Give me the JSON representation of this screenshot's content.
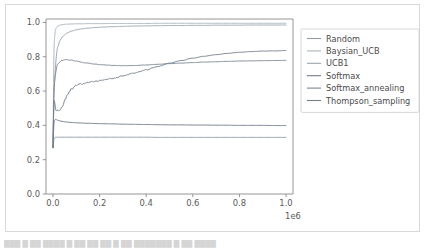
{
  "figure": {
    "background_color": "#ffffff",
    "border_color": "#d8d8d8",
    "axis_color": "#8a8a8a",
    "text_color": "#5a5a5a"
  },
  "footer": {
    "fragment_text": "███   █  ██   ████  █  ██ ██  ██   █  ██ ███████  █  ██ ████"
  },
  "legend": {
    "position": "right-outside",
    "entries": [
      {
        "label": "Random",
        "color": "#8f9ba8"
      },
      {
        "label": "Baysian_UCB",
        "color": "#aab4bd"
      },
      {
        "label": "UCB1",
        "color": "#9aa5b0"
      },
      {
        "label": "Softmax",
        "color": "#6f7b88"
      },
      {
        "label": "Softmax_annealing",
        "color": "#7b8794"
      },
      {
        "label": "Thompson_sampling",
        "color": "#737f8c"
      }
    ]
  },
  "chart_data": {
    "type": "line",
    "title": "",
    "xlabel": "",
    "ylabel": "",
    "xlim": [
      -0.03,
      1.03
    ],
    "ylim": [
      0.0,
      1.02
    ],
    "x_exponent_label": "1e6",
    "grid": false,
    "xticks": [
      "0.0",
      "0.2",
      "0.4",
      "0.6",
      "0.8",
      "1.0"
    ],
    "xtick_values": [
      0.0,
      0.2,
      0.4,
      0.6,
      0.8,
      1.0
    ],
    "yticks": [
      "0.0",
      "0.2",
      "0.4",
      "0.6",
      "0.8",
      "1.0"
    ],
    "ytick_values": [
      0.0,
      0.2,
      0.4,
      0.6,
      0.8,
      1.0
    ],
    "x": [
      0.0,
      0.005,
      0.01,
      0.015,
      0.02,
      0.03,
      0.04,
      0.05,
      0.06,
      0.08,
      0.1,
      0.12,
      0.15,
      0.18,
      0.2,
      0.25,
      0.3,
      0.35,
      0.4,
      0.45,
      0.5,
      0.55,
      0.6,
      0.65,
      0.7,
      0.75,
      0.8,
      0.85,
      0.9,
      0.95,
      1.0
    ],
    "series": [
      {
        "name": "Random",
        "color": "#8f9ba8",
        "final_value": 0.33,
        "values": [
          0.27,
          0.325,
          0.33,
          0.331,
          0.331,
          0.331,
          0.331,
          0.331,
          0.331,
          0.331,
          0.331,
          0.331,
          0.331,
          0.331,
          0.331,
          0.331,
          0.331,
          0.331,
          0.331,
          0.33,
          0.33,
          0.33,
          0.33,
          0.33,
          0.33,
          0.33,
          0.33,
          0.33,
          0.33,
          0.33,
          0.33
        ]
      },
      {
        "name": "Baysian_UCB",
        "color": "#aab4bd",
        "final_value": 0.995,
        "values": [
          0.27,
          0.88,
          0.955,
          0.972,
          0.978,
          0.984,
          0.987,
          0.989,
          0.99,
          0.991,
          0.992,
          0.992,
          0.993,
          0.993,
          0.993,
          0.994,
          0.994,
          0.994,
          0.994,
          0.995,
          0.995,
          0.995,
          0.995,
          0.995,
          0.995,
          0.995,
          0.995,
          0.995,
          0.995,
          0.995,
          0.995
        ]
      },
      {
        "name": "UCB1",
        "color": "#9aa5b0",
        "final_value": 0.985,
        "values": [
          0.27,
          0.6,
          0.74,
          0.815,
          0.855,
          0.895,
          0.915,
          0.928,
          0.938,
          0.95,
          0.957,
          0.962,
          0.967,
          0.97,
          0.972,
          0.975,
          0.977,
          0.979,
          0.98,
          0.981,
          0.982,
          0.982,
          0.983,
          0.983,
          0.984,
          0.984,
          0.984,
          0.985,
          0.985,
          0.985,
          0.985
        ]
      },
      {
        "name": "Softmax",
        "color": "#6f7b88",
        "final_value": 0.4,
        "values": [
          0.27,
          0.425,
          0.435,
          0.433,
          0.43,
          0.426,
          0.423,
          0.421,
          0.419,
          0.417,
          0.415,
          0.414,
          0.412,
          0.411,
          0.41,
          0.409,
          0.407,
          0.406,
          0.405,
          0.404,
          0.403,
          0.403,
          0.402,
          0.402,
          0.401,
          0.401,
          0.4,
          0.4,
          0.4,
          0.399,
          0.399
        ]
      },
      {
        "name": "Softmax_annealing",
        "color": "#7b8794",
        "final_value": 0.78,
        "values": [
          0.27,
          0.62,
          0.695,
          0.735,
          0.755,
          0.772,
          0.779,
          0.782,
          0.783,
          0.78,
          0.775,
          0.769,
          0.762,
          0.757,
          0.754,
          0.75,
          0.748,
          0.749,
          0.752,
          0.756,
          0.76,
          0.763,
          0.766,
          0.769,
          0.771,
          0.773,
          0.775,
          0.776,
          0.777,
          0.778,
          0.779
        ]
      },
      {
        "name": "Thompson_sampling",
        "color": "#737f8c",
        "final_value": 0.835,
        "values": [
          0.27,
          0.56,
          0.505,
          0.487,
          0.492,
          0.486,
          0.505,
          0.545,
          0.578,
          0.612,
          0.632,
          0.641,
          0.65,
          0.656,
          0.661,
          0.672,
          0.688,
          0.706,
          0.724,
          0.744,
          0.762,
          0.778,
          0.792,
          0.803,
          0.812,
          0.82,
          0.826,
          0.83,
          0.833,
          0.834,
          0.836
        ]
      }
    ]
  }
}
